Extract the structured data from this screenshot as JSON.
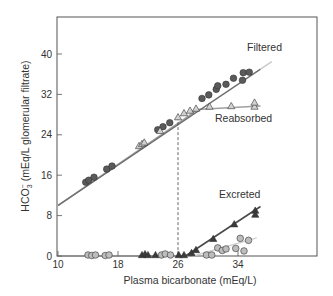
{
  "chart_data": {
    "type": "scatter",
    "title": "",
    "xlabel": "Plasma bicarbonate (mEq/L)",
    "ylabel": "HCO3⁻ (mEq/L glomerular filtrate)",
    "ylabel_main": "HCO",
    "ylabel_sub": "3",
    "ylabel_sup": "−",
    "ylabel_rest": " (mEq/L glomerular filtrate)",
    "xlim": [
      10,
      44
    ],
    "ylim": [
      0,
      47
    ],
    "xticks": [
      10,
      18,
      26,
      34
    ],
    "yticks": [
      0,
      8,
      16,
      24,
      32,
      40
    ],
    "xtick_labels": [
      "10",
      "18",
      "26",
      "34"
    ],
    "ytick_labels": [
      "0",
      "8",
      "16",
      "24",
      "32",
      "40"
    ],
    "threshold_x": 26,
    "series": [
      {
        "name": "Filtered",
        "label": "Filtered",
        "marker": "circle",
        "fill": "#5a5a5a",
        "line": {
          "points": [
            [
              10,
              10
            ],
            [
              37,
              37
            ]
          ],
          "color": "#6e6e6e"
        },
        "line_ext": {
          "points": [
            [
              37,
              37
            ],
            [
              38.5,
              38.5
            ]
          ],
          "color": "#c8c8c8"
        },
        "points": [
          [
            13.7,
            14.6
          ],
          [
            14.1,
            15.0
          ],
          [
            14.8,
            15.6
          ],
          [
            16.5,
            17.2
          ],
          [
            17.2,
            17.8
          ],
          [
            23.3,
            25.0
          ],
          [
            24.0,
            25.6
          ],
          [
            24.9,
            26.4
          ],
          [
            29.2,
            31.2
          ],
          [
            30.1,
            31.9
          ],
          [
            31.1,
            33.0
          ],
          [
            31.3,
            33.7
          ],
          [
            32.4,
            34.0
          ],
          [
            33.4,
            35.2
          ],
          [
            34.6,
            34.8
          ],
          [
            34.7,
            36.3
          ],
          [
            35.5,
            36.4
          ]
        ]
      },
      {
        "name": "Reabsorbed",
        "label": "Reabsorbed",
        "marker": "triangle",
        "fill": "#d2d2d2",
        "line": {
          "points": [
            [
              10,
              10
            ],
            [
              27.5,
              27.8
            ],
            [
              28.5,
              29.0
            ],
            [
              37,
              29.7
            ]
          ],
          "color": "#a0a0a0"
        },
        "points": [
          [
            20.8,
            21.8
          ],
          [
            21.2,
            22.2
          ],
          [
            21.5,
            22.5
          ],
          [
            23.6,
            24.8
          ],
          [
            26.0,
            27.5
          ],
          [
            26.8,
            28.3
          ],
          [
            27.6,
            28.8
          ],
          [
            28.4,
            29.2
          ],
          [
            30.2,
            29.6
          ],
          [
            33.1,
            29.7
          ],
          [
            36.2,
            29.6
          ],
          [
            36.2,
            30.4
          ]
        ]
      },
      {
        "name": "Excreted",
        "label": "Excreted",
        "marker": "triangle",
        "fill": "#3a3a3a",
        "line": {
          "points": [
            [
              27.0,
              0
            ],
            [
              37,
              9.8
            ]
          ],
          "color": "#4a4a4a"
        },
        "baseline": {
          "points": [
            [
              10,
              0
            ],
            [
              27.0,
              0
            ]
          ],
          "color": "#7a7a7a"
        },
        "points": [
          [
            21.2,
            0.2
          ],
          [
            21.6,
            0.4
          ],
          [
            22.0,
            0.2
          ],
          [
            23.0,
            0.2
          ],
          [
            26.1,
            0.2
          ],
          [
            26.8,
            0.2
          ],
          [
            27.8,
            0.6
          ],
          [
            28.4,
            1.2
          ],
          [
            30.7,
            3.4
          ],
          [
            33.5,
            6.3
          ],
          [
            36.3,
            9.0
          ],
          [
            36.3,
            8.2
          ]
        ]
      },
      {
        "name": "Excreted (lower)",
        "label": "",
        "marker": "circle",
        "fill": "#bdbdbd",
        "line": {
          "points": [
            [
              28,
              0
            ],
            [
              36.5,
              3.6
            ]
          ],
          "color": "#cfcfcf"
        },
        "points": [
          [
            14.0,
            0.2
          ],
          [
            14.5,
            0.1
          ],
          [
            15.0,
            0.2
          ],
          [
            16.3,
            0.1
          ],
          [
            16.8,
            0.2
          ],
          [
            23.8,
            0.2
          ],
          [
            24.3,
            0.4
          ],
          [
            25.0,
            0.2
          ],
          [
            29.8,
            0.2
          ],
          [
            30.5,
            0.2
          ],
          [
            31.3,
            1.6
          ],
          [
            31.9,
            1.1
          ],
          [
            32.4,
            1.4
          ],
          [
            33.7,
            1.5
          ],
          [
            34.3,
            3.5
          ],
          [
            34.8,
            1.0
          ],
          [
            35.4,
            3.1
          ]
        ]
      }
    ],
    "grid": false,
    "legend": "inline labels"
  }
}
